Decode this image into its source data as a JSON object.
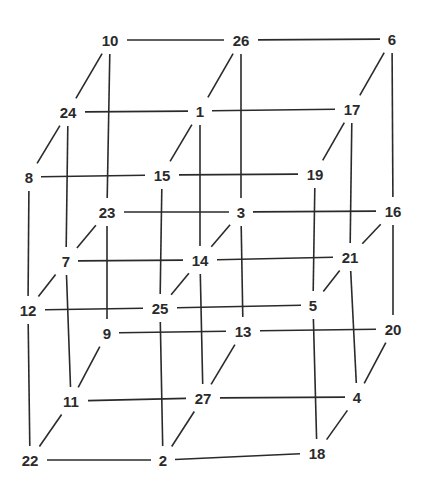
{
  "diagram": {
    "line_color": "#2a2a2a",
    "background": "#ffffff",
    "nodes": [
      {
        "id": "10",
        "label": "10",
        "layer": "top",
        "depth": "back",
        "col": 0,
        "x": 110,
        "y": 40
      },
      {
        "id": "26",
        "label": "26",
        "layer": "top",
        "depth": "back",
        "col": 1,
        "x": 241,
        "y": 40
      },
      {
        "id": "6",
        "label": "6",
        "layer": "top",
        "depth": "back",
        "col": 2,
        "x": 392,
        "y": 39
      },
      {
        "id": "24",
        "label": "24",
        "layer": "top",
        "depth": "mid",
        "col": 0,
        "x": 68,
        "y": 112
      },
      {
        "id": "1",
        "label": "1",
        "layer": "top",
        "depth": "mid",
        "col": 1,
        "x": 200,
        "y": 111
      },
      {
        "id": "17",
        "label": "17",
        "layer": "top",
        "depth": "mid",
        "col": 2,
        "x": 352,
        "y": 109
      },
      {
        "id": "8",
        "label": "8",
        "layer": "top",
        "depth": "front",
        "col": 0,
        "x": 29,
        "y": 177
      },
      {
        "id": "15",
        "label": "15",
        "layer": "top",
        "depth": "front",
        "col": 1,
        "x": 162,
        "y": 175
      },
      {
        "id": "19",
        "label": "19",
        "layer": "top",
        "depth": "front",
        "col": 2,
        "x": 315,
        "y": 174
      },
      {
        "id": "23",
        "label": "23",
        "layer": "middle",
        "depth": "back",
        "col": 0,
        "x": 107,
        "y": 212
      },
      {
        "id": "3",
        "label": "3",
        "layer": "middle",
        "depth": "back",
        "col": 1,
        "x": 241,
        "y": 212
      },
      {
        "id": "16",
        "label": "16",
        "layer": "middle",
        "depth": "back",
        "col": 2,
        "x": 393,
        "y": 211
      },
      {
        "id": "7",
        "label": "7",
        "layer": "middle",
        "depth": "mid",
        "col": 0,
        "x": 66,
        "y": 261
      },
      {
        "id": "14",
        "label": "14",
        "layer": "middle",
        "depth": "mid",
        "col": 1,
        "x": 200,
        "y": 260
      },
      {
        "id": "21",
        "label": "21",
        "layer": "middle",
        "depth": "mid",
        "col": 2,
        "x": 350,
        "y": 257
      },
      {
        "id": "12",
        "label": "12",
        "layer": "middle",
        "depth": "front",
        "col": 0,
        "x": 28,
        "y": 310
      },
      {
        "id": "25",
        "label": "25",
        "layer": "middle",
        "depth": "front",
        "col": 1,
        "x": 160,
        "y": 308
      },
      {
        "id": "5",
        "label": "5",
        "layer": "middle",
        "depth": "front",
        "col": 2,
        "x": 313,
        "y": 305
      },
      {
        "id": "9",
        "label": "9",
        "layer": "bottom",
        "depth": "back",
        "col": 0,
        "x": 107,
        "y": 333
      },
      {
        "id": "13",
        "label": "13",
        "layer": "bottom",
        "depth": "back",
        "col": 1,
        "x": 243,
        "y": 331
      },
      {
        "id": "20",
        "label": "20",
        "layer": "bottom",
        "depth": "back",
        "col": 2,
        "x": 393,
        "y": 329
      },
      {
        "id": "11",
        "label": "11",
        "layer": "bottom",
        "depth": "mid",
        "col": 0,
        "x": 71,
        "y": 401
      },
      {
        "id": "27",
        "label": "27",
        "layer": "bottom",
        "depth": "mid",
        "col": 1,
        "x": 203,
        "y": 398
      },
      {
        "id": "4",
        "label": "4",
        "layer": "bottom",
        "depth": "mid",
        "col": 2,
        "x": 357,
        "y": 397
      },
      {
        "id": "22",
        "label": "22",
        "layer": "bottom",
        "depth": "front",
        "col": 0,
        "x": 30,
        "y": 460
      },
      {
        "id": "2",
        "label": "2",
        "layer": "bottom",
        "depth": "front",
        "col": 1,
        "x": 163,
        "y": 460
      },
      {
        "id": "18",
        "label": "18",
        "layer": "bottom",
        "depth": "front",
        "col": 2,
        "x": 317,
        "y": 453
      }
    ],
    "edges": [
      [
        "10",
        "26"
      ],
      [
        "26",
        "6"
      ],
      [
        "24",
        "1"
      ],
      [
        "1",
        "17"
      ],
      [
        "8",
        "15"
      ],
      [
        "15",
        "19"
      ],
      [
        "23",
        "3"
      ],
      [
        "3",
        "16"
      ],
      [
        "7",
        "14"
      ],
      [
        "14",
        "21"
      ],
      [
        "12",
        "25"
      ],
      [
        "25",
        "5"
      ],
      [
        "9",
        "13"
      ],
      [
        "13",
        "20"
      ],
      [
        "11",
        "27"
      ],
      [
        "27",
        "4"
      ],
      [
        "22",
        "2"
      ],
      [
        "2",
        "18"
      ],
      [
        "10",
        "24"
      ],
      [
        "24",
        "8"
      ],
      [
        "26",
        "1"
      ],
      [
        "1",
        "15"
      ],
      [
        "6",
        "17"
      ],
      [
        "17",
        "19"
      ],
      [
        "23",
        "7"
      ],
      [
        "7",
        "12"
      ],
      [
        "3",
        "14"
      ],
      [
        "14",
        "25"
      ],
      [
        "16",
        "21"
      ],
      [
        "21",
        "5"
      ],
      [
        "9",
        "11"
      ],
      [
        "11",
        "22"
      ],
      [
        "13",
        "27"
      ],
      [
        "27",
        "2"
      ],
      [
        "20",
        "4"
      ],
      [
        "4",
        "18"
      ],
      [
        "10",
        "23"
      ],
      [
        "23",
        "9"
      ],
      [
        "26",
        "3"
      ],
      [
        "3",
        "13"
      ],
      [
        "6",
        "16"
      ],
      [
        "16",
        "20"
      ],
      [
        "24",
        "7"
      ],
      [
        "7",
        "11"
      ],
      [
        "1",
        "14"
      ],
      [
        "14",
        "27"
      ],
      [
        "17",
        "21"
      ],
      [
        "21",
        "4"
      ],
      [
        "8",
        "12"
      ],
      [
        "12",
        "22"
      ],
      [
        "15",
        "25"
      ],
      [
        "25",
        "2"
      ],
      [
        "19",
        "5"
      ],
      [
        "5",
        "18"
      ]
    ]
  }
}
